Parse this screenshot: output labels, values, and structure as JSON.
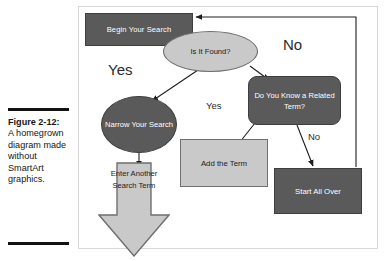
{
  "caption": {
    "label": "Figure 2-12:",
    "body": "A homegrown diagram made without SmartArt graphics."
  },
  "diagram": {
    "nodes": [
      {
        "id": "begin-search",
        "text": "Begin Your Search",
        "shape": "rectangle",
        "fill": "#5a5a5a",
        "text_color": "#ffffff"
      },
      {
        "id": "is-it-found",
        "text": "Is It Found?",
        "shape": "ellipse",
        "fill": "#c9c9c9",
        "text_color": "#1a1a1a"
      },
      {
        "id": "do-you-know",
        "text": "Do You Know a Related Term?",
        "shape": "rounded-rect",
        "fill": "#5a5a5a",
        "text_color": "#ffffff"
      },
      {
        "id": "narrow-search",
        "text": "Narrow Your Search",
        "shape": "ellipse",
        "fill": "#5a5a5a",
        "text_color": "#ffffff"
      },
      {
        "id": "add-term",
        "text": "Add the Term",
        "shape": "rectangle",
        "fill": "#c9c9c9",
        "text_color": "#1a1a1a"
      },
      {
        "id": "start-over",
        "text": "Start All Over",
        "shape": "rectangle",
        "fill": "#5a5a5a",
        "text_color": "#ffffff"
      },
      {
        "id": "enter-another",
        "text": "Enter Another Search Term",
        "shape": "down-arrow",
        "fill": "#c9c9c9",
        "text_color": "#1a1a1a"
      }
    ],
    "edge_labels": {
      "yes_primary": "Yes",
      "no_primary": "No",
      "yes_secondary": "Yes",
      "no_secondary": "No"
    },
    "colors": {
      "dark_fill": "#5a5a5a",
      "light_fill": "#c9c9c9",
      "dark_stroke": "#3e3e3e",
      "light_stroke": "#6f6f6f",
      "connector": "#1e1e1e",
      "frame_border": "#d8d8d8",
      "page_background": "#ffffff"
    }
  }
}
